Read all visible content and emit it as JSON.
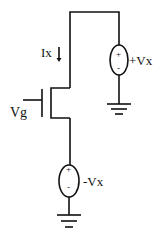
{
  "diagram": {
    "type": "circuit-schematic",
    "labels": {
      "current": "Ix",
      "gate": "Vg",
      "drain_source": "+Vx",
      "source_source": "-Vx"
    },
    "source_signs": {
      "drain_plus": "+",
      "drain_minus": "-",
      "source_plus": "+",
      "source_minus": "-"
    },
    "colors": {
      "stroke": "#111111",
      "background": "#ffffff"
    },
    "components": [
      {
        "name": "nmos-transistor",
        "terminals": [
          "gate",
          "drain",
          "source"
        ]
      },
      {
        "name": "voltage-source-drain",
        "value": "+Vx"
      },
      {
        "name": "voltage-source-source",
        "value": "-Vx"
      },
      {
        "name": "ground-drain"
      },
      {
        "name": "ground-source"
      }
    ]
  }
}
